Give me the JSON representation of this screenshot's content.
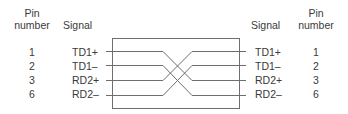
{
  "diagram": {
    "type": "crossover-cable-pinout",
    "left": {
      "headers": {
        "pin_line1": "Pin",
        "pin_line2": "number",
        "signal": "Signal"
      },
      "rows": [
        {
          "pin": "1",
          "signal": "TD1+"
        },
        {
          "pin": "2",
          "signal": "TD1–"
        },
        {
          "pin": "3",
          "signal": "RD2+"
        },
        {
          "pin": "6",
          "signal": "RD2–"
        }
      ]
    },
    "right": {
      "headers": {
        "signal": "Signal",
        "pin_line1": "Pin",
        "pin_line2": "number"
      },
      "rows": [
        {
          "pin": "1",
          "signal": "TD1+"
        },
        {
          "pin": "2",
          "signal": "TD1–"
        },
        {
          "pin": "3",
          "signal": "RD2+"
        },
        {
          "pin": "6",
          "signal": "RD2–"
        }
      ]
    },
    "connections": [
      {
        "from": "TD1+",
        "to": "RD2+"
      },
      {
        "from": "TD1–",
        "to": "RD2–"
      },
      {
        "from": "RD2+",
        "to": "TD1+"
      },
      {
        "from": "RD2–",
        "to": "TD1–"
      }
    ],
    "colors": {
      "line": "#6e6e6e",
      "text": "#3a3a3a",
      "background": "#ffffff"
    }
  }
}
